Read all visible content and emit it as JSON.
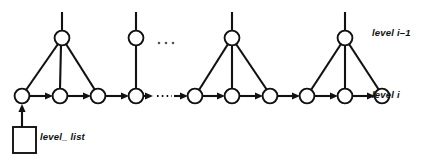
{
  "diagram": {
    "type": "node-link-diagram",
    "colors": {
      "stroke": "#111111",
      "background": "#ffffff",
      "node_fill": "#ffffff",
      "ellipsis": "#555555"
    },
    "labels": {
      "level_above": "level i–1",
      "level_current": "level i",
      "list_head": "level_ list"
    },
    "geometry": {
      "width": 427,
      "height": 163,
      "bottom_row_y": 96,
      "top_row_y": 38,
      "node_radius": 7.4,
      "top_stub_top_y": 12
    },
    "bottom_nodes": [
      {
        "id": "b0",
        "x": 22,
        "y": 96
      },
      {
        "id": "b1",
        "x": 60,
        "y": 96
      },
      {
        "id": "b2",
        "x": 98,
        "y": 96
      },
      {
        "id": "b3",
        "x": 136,
        "y": 96
      },
      {
        "id": "b4",
        "x": 195,
        "y": 96
      },
      {
        "id": "b5",
        "x": 232,
        "y": 96
      },
      {
        "id": "b6",
        "x": 270,
        "y": 96
      },
      {
        "id": "b7",
        "x": 307,
        "y": 96
      },
      {
        "id": "b8",
        "x": 345,
        "y": 96
      },
      {
        "id": "b9",
        "x": 382,
        "y": 96
      }
    ],
    "top_nodes": [
      {
        "id": "t0",
        "x": 62,
        "y": 38,
        "children": [
          "b0",
          "b1",
          "b2"
        ]
      },
      {
        "id": "t1",
        "x": 136,
        "y": 38,
        "children": [
          "b3"
        ]
      },
      {
        "id": "t2",
        "x": 232,
        "y": 38,
        "children": [
          "b4",
          "b5",
          "b6"
        ]
      },
      {
        "id": "t3",
        "x": 345,
        "y": 38,
        "children": [
          "b7",
          "b8",
          "b9"
        ]
      }
    ],
    "chain_arrows": [
      {
        "from": "b0",
        "to": "b1"
      },
      {
        "from": "b1",
        "to": "b2"
      },
      {
        "from": "b2",
        "to": "b3"
      },
      {
        "from": "b4",
        "to": "b5"
      },
      {
        "from": "b5",
        "to": "b6"
      },
      {
        "from": "b6",
        "to": "b7"
      },
      {
        "from": "b7",
        "to": "b8"
      },
      {
        "from": "b8",
        "to": "b9"
      }
    ],
    "dotted_gaps": [
      {
        "from": "b3",
        "to": "b4",
        "y": 96
      }
    ],
    "top_ellipsis": {
      "x": 166,
      "y": 43,
      "dots": 3
    },
    "head_box": {
      "x": 13,
      "y": 127,
      "width": 23,
      "height": 26
    },
    "head_arrow": {
      "x": 22,
      "from_y": 127,
      "to_y": 106
    }
  }
}
